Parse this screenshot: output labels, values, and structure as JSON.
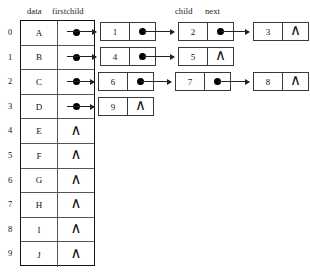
{
  "diagram": {
    "headers": {
      "data": "data",
      "firstchild": "firstchild",
      "child": "child",
      "next": "next"
    },
    "symbols": {
      "null": "∧",
      "pointer": "pointer-dot"
    },
    "vertex_array": [
      {
        "index": "0",
        "data": "A",
        "firstchild": "pointer"
      },
      {
        "index": "1",
        "data": "B",
        "firstchild": "pointer"
      },
      {
        "index": "2",
        "data": "C",
        "firstchild": "pointer"
      },
      {
        "index": "3",
        "data": "D",
        "firstchild": "pointer"
      },
      {
        "index": "4",
        "data": "E",
        "firstchild": "null"
      },
      {
        "index": "5",
        "data": "F",
        "firstchild": "null"
      },
      {
        "index": "6",
        "data": "G",
        "firstchild": "null"
      },
      {
        "index": "7",
        "data": "H",
        "firstchild": "null"
      },
      {
        "index": "8",
        "data": "I",
        "firstchild": "null"
      },
      {
        "index": "9",
        "data": "J",
        "firstchild": "null"
      }
    ],
    "chains": [
      {
        "row": "0",
        "nodes": [
          {
            "child": "1",
            "next": "pointer"
          },
          {
            "child": "2",
            "next": "pointer"
          },
          {
            "child": "3",
            "next": "null"
          }
        ]
      },
      {
        "row": "1",
        "nodes": [
          {
            "child": "4",
            "next": "pointer"
          },
          {
            "child": "5",
            "next": "null"
          }
        ]
      },
      {
        "row": "2",
        "nodes": [
          {
            "child": "6",
            "next": "pointer"
          },
          {
            "child": "7",
            "next": "pointer"
          },
          {
            "child": "8",
            "next": "null"
          }
        ]
      },
      {
        "row": "3",
        "nodes": [
          {
            "child": "9",
            "next": "null"
          }
        ]
      }
    ]
  },
  "colors": {
    "ink": "#111111",
    "rule": "#555555",
    "node_border": "#3a3a3a",
    "background": "#ffffff"
  }
}
